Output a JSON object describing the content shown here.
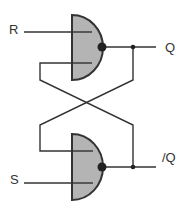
{
  "labels": {
    "r": "R",
    "s": "S",
    "q": "Q",
    "q_bar": "/Q"
  },
  "colors": {
    "gate_fill": "#b4b4b4",
    "stroke": "#333333",
    "background": "#ffffff"
  },
  "gates": [
    {
      "name": "top-nand-gate",
      "type": "NAND",
      "inputs": [
        "R",
        "/Q"
      ],
      "output": "Q"
    },
    {
      "name": "bottom-nand-gate",
      "type": "NAND",
      "inputs": [
        "Q",
        "S"
      ],
      "output": "/Q"
    }
  ]
}
